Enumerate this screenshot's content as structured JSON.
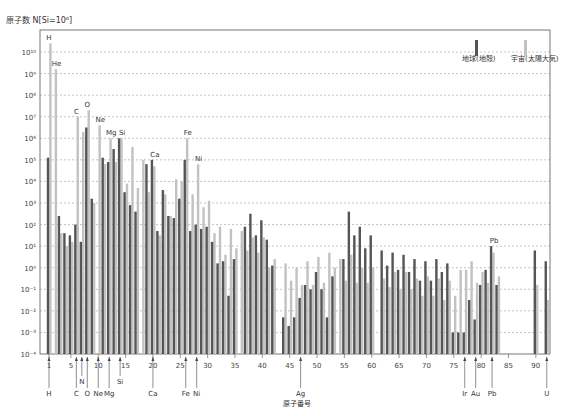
{
  "chart_data": {
    "type": "bar",
    "title": "",
    "ylabel": "原子数 N[Si=10⁶]",
    "xlabel": "原子番号",
    "yscale": "log",
    "ylim_exp": [
      -4,
      10
    ],
    "ytick_labels": [
      "10⁻⁴",
      "10⁻³",
      "10⁻²",
      "10⁻¹",
      "10⁰",
      "10¹",
      "10²",
      "10³",
      "10⁴",
      "10⁵",
      "10⁶",
      "10⁷",
      "10⁸",
      "10⁹",
      "10¹⁰"
    ],
    "xticks": [
      1,
      5,
      10,
      15,
      20,
      25,
      30,
      35,
      40,
      45,
      50,
      55,
      60,
      65,
      70,
      75,
      80,
      85,
      90
    ],
    "grid": "horizontal dashed",
    "legend_position": "top-right",
    "colors": {
      "earth": "#555555",
      "cosmic": "#c2c2c2"
    },
    "series": [
      {
        "name": "地球(地殻)",
        "key": "earth",
        "log10_values": {
          "1": 5.1,
          "2": null,
          "3": 2.4,
          "4": 1.6,
          "5": 1.5,
          "6": 2.0,
          "7": 1.2,
          "8": 6.5,
          "9": 3.2,
          "10": null,
          "11": 5.1,
          "12": 4.9,
          "13": 5.5,
          "14": 6.0,
          "15": 3.5,
          "16": 2.9,
          "17": 2.6,
          "18": null,
          "19": 4.8,
          "20": 5.0,
          "21": 1.7,
          "22": 3.6,
          "23": 2.4,
          "24": 2.3,
          "25": 3.2,
          "26": 5.0,
          "27": 1.7,
          "28": 2.0,
          "29": 1.8,
          "30": 1.9,
          "31": 1.2,
          "32": 0.2,
          "33": 0.3,
          "34": -1.3,
          "35": 0.4,
          "36": null,
          "37": 1.9,
          "38": 2.5,
          "39": 1.5,
          "40": 2.2,
          "41": 1.3,
          "42": 0.1,
          "43": null,
          "44": -2.3,
          "45": -2.7,
          "46": -2.3,
          "47": -1.4,
          "48": -0.8,
          "49": -1.0,
          "50": -0.2,
          "51": -1.0,
          "52": -2.3,
          "53": -0.4,
          "54": null,
          "55": 0.4,
          "56": 2.6,
          "57": 1.5,
          "58": 1.9,
          "59": 0.9,
          "60": 1.5,
          "61": null,
          "62": 0.8,
          "63": 0.1,
          "64": 0.7,
          "65": -0.1,
          "66": 0.6,
          "67": -0.2,
          "68": 0.4,
          "69": -0.6,
          "70": 0.3,
          "71": -0.6,
          "72": 0.4,
          "73": -0.2,
          "74": 0.2,
          "75": -3.0,
          "76": -3.0,
          "77": -3.0,
          "78": -1.5,
          "79": -2.4,
          "80": -0.8,
          "81": -0.1,
          "82": 1.0,
          "83": -0.8,
          "90": 0.8,
          "92": 0.3
        }
      },
      {
        "name": "宇宙(太陽大気)",
        "key": "cosmic",
        "log10_values": {
          "1": 10.4,
          "2": 9.2,
          "3": 1.6,
          "4": 1.0,
          "5": 1.2,
          "6": 7.0,
          "7": 6.3,
          "8": 7.3,
          "9": 3.0,
          "10": 6.6,
          "11": 4.8,
          "12": 6.0,
          "13": 4.9,
          "14": 6.0,
          "15": 3.9,
          "16": 5.6,
          "17": 3.7,
          "18": 5.0,
          "19": 3.5,
          "20": 4.7,
          "21": 1.5,
          "22": 3.4,
          "23": 2.4,
          "24": 4.1,
          "25": 4.0,
          "26": 6.0,
          "27": 3.4,
          "28": 4.8,
          "29": 2.8,
          "30": 3.1,
          "31": 1.6,
          "32": 1.9,
          "33": 0.6,
          "34": 1.8,
          "35": 0.9,
          "36": 1.7,
          "37": 0.8,
          "38": 1.4,
          "39": 0.7,
          "40": 1.4,
          "41": 0.0,
          "42": 0.4,
          "43": null,
          "44": 0.2,
          "45": -0.6,
          "46": 0.0,
          "47": -0.8,
          "48": 0.3,
          "49": -0.8,
          "50": 0.5,
          "51": -0.7,
          "52": 0.7,
          "53": 0.0,
          "54": 0.4,
          "55": -0.6,
          "56": 0.6,
          "57": -0.7,
          "58": 0.0,
          "59": -0.7,
          "60": 0.0,
          "61": null,
          "62": -0.5,
          "63": -0.9,
          "64": -0.2,
          "65": -1.0,
          "66": -0.2,
          "67": -1.0,
          "68": -0.5,
          "69": -1.3,
          "70": -0.4,
          "71": -1.3,
          "72": -0.5,
          "73": -1.5,
          "74": -0.6,
          "75": -1.3,
          "76": -0.1,
          "77": -0.1,
          "78": 0.3,
          "79": -0.7,
          "80": -0.2,
          "81": -0.7,
          "82": 0.7,
          "83": -0.4,
          "90": -0.8,
          "92": -1.5
        }
      }
    ],
    "bar_labels": [
      {
        "element": 1,
        "label": "H"
      },
      {
        "element": 2,
        "label": "He"
      },
      {
        "element": 6,
        "label": "C"
      },
      {
        "element": 8,
        "label": "O"
      },
      {
        "element": 10,
        "label": "Ne"
      },
      {
        "element": 12,
        "label": "Mg"
      },
      {
        "element": 14,
        "label": "Si"
      },
      {
        "element": 20,
        "label": "Ca"
      },
      {
        "element": 26,
        "label": "Fe"
      },
      {
        "element": 28,
        "label": "Ni"
      },
      {
        "element": 82,
        "label": "Pb"
      }
    ],
    "bottom_markers": [
      {
        "element": 1,
        "label": "H",
        "row": 2
      },
      {
        "element": 6,
        "label": "C",
        "row": 2
      },
      {
        "element": 7,
        "label": "N",
        "row": 1
      },
      {
        "element": 8,
        "label": "O",
        "row": 2
      },
      {
        "element": 10,
        "label": "Ne",
        "row": 2
      },
      {
        "element": 12,
        "label": "Mg",
        "row": 2
      },
      {
        "element": 14,
        "label": "Si",
        "row": 1
      },
      {
        "element": 20,
        "label": "Ca",
        "row": 2
      },
      {
        "element": 26,
        "label": "Fe",
        "row": 2
      },
      {
        "element": 28,
        "label": "Ni",
        "row": 2
      },
      {
        "element": 47,
        "label": "Ag",
        "row": 2
      },
      {
        "element": 77,
        "label": "Ir",
        "row": 2
      },
      {
        "element": 79,
        "label": "Au",
        "row": 2
      },
      {
        "element": 82,
        "label": "Pb",
        "row": 2
      },
      {
        "element": 92,
        "label": "U",
        "row": 2
      }
    ],
    "legend": [
      {
        "label": "地球(地殻)",
        "key": "earth"
      },
      {
        "label": "宇宙(太陽大気)",
        "key": "cosmic"
      }
    ]
  },
  "labels": {
    "y_axis_title": "原子数 N[Si=10⁶]",
    "x_axis_title": "原子番号",
    "legend_earth": "地球(地殻)",
    "legend_cosmic": "宇宙(太陽大気)"
  }
}
